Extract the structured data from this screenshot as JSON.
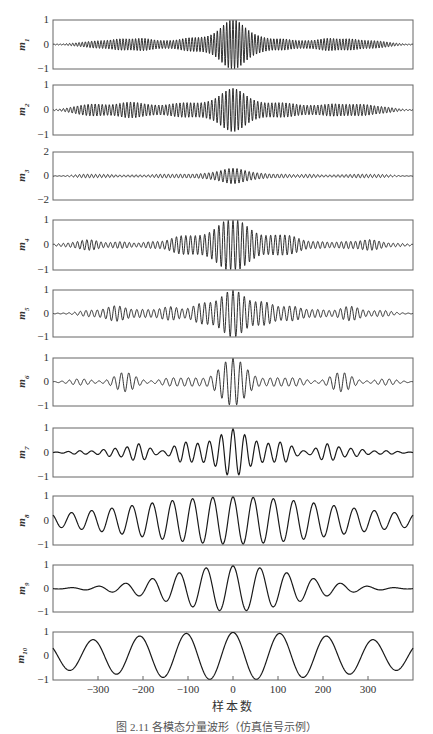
{
  "figure": {
    "xlabel": "样本数",
    "caption": "图 2.11  各模态分量波形（仿真信号示例）"
  },
  "chart_data": {
    "type": "line",
    "title": "",
    "xlabel": "样本数",
    "xlim": [
      -400,
      400
    ],
    "xticks": [
      -300,
      -200,
      -100,
      0,
      100,
      200,
      300
    ],
    "grid": false,
    "legend": null,
    "panels": [
      {
        "name": "m1",
        "ylabel": "m1",
        "ylim": [
          -1,
          1
        ],
        "yticks": [
          "1",
          "0",
          "-1"
        ],
        "style": "dense",
        "freq": 0.9,
        "amp": 1.0,
        "env": "bursts",
        "bursts": [
          [
            -340,
            0.05
          ],
          [
            -300,
            0.12
          ],
          [
            -250,
            0.2
          ],
          [
            -200,
            0.22
          ],
          [
            -150,
            0.12
          ],
          [
            -100,
            0.22
          ],
          [
            -60,
            0.18
          ],
          [
            0,
            1.0
          ],
          [
            60,
            0.22
          ],
          [
            110,
            0.2
          ],
          [
            160,
            0.12
          ],
          [
            210,
            0.22
          ],
          [
            260,
            0.2
          ],
          [
            310,
            0.12
          ],
          [
            345,
            0.05
          ]
        ]
      },
      {
        "name": "m2",
        "ylabel": "m2",
        "ylim": [
          -1,
          1
        ],
        "yticks": [
          "1",
          "0",
          "-1"
        ],
        "style": "dense",
        "freq": 0.8,
        "amp": 0.9,
        "env": "bursts",
        "bursts": [
          [
            -350,
            0.1
          ],
          [
            -315,
            0.18
          ],
          [
            -285,
            0.12
          ],
          [
            -245,
            0.2
          ],
          [
            -215,
            0.22
          ],
          [
            -175,
            0.15
          ],
          [
            -130,
            0.2
          ],
          [
            -95,
            0.22
          ],
          [
            -55,
            0.2
          ],
          [
            0,
            0.95
          ],
          [
            55,
            0.2
          ],
          [
            95,
            0.22
          ],
          [
            130,
            0.2
          ],
          [
            175,
            0.15
          ],
          [
            220,
            0.22
          ],
          [
            260,
            0.15
          ],
          [
            295,
            0.18
          ],
          [
            340,
            0.1
          ]
        ]
      },
      {
        "name": "m3",
        "ylabel": "m3",
        "ylim": [
          -2,
          2
        ],
        "yticks": [
          "2",
          "0",
          "-2"
        ],
        "style": "dense",
        "freq": 0.7,
        "amp": 0.65,
        "env": "bursts",
        "bursts": [
          [
            -330,
            0.12
          ],
          [
            -280,
            0.1
          ],
          [
            -220,
            0.08
          ],
          [
            -160,
            0.12
          ],
          [
            -110,
            0.12
          ],
          [
            -60,
            0.15
          ],
          [
            0,
            0.6
          ],
          [
            60,
            0.15
          ],
          [
            110,
            0.12
          ],
          [
            170,
            0.12
          ],
          [
            230,
            0.08
          ],
          [
            280,
            0.12
          ],
          [
            330,
            0.1
          ]
        ]
      },
      {
        "name": "m4",
        "ylabel": "m4",
        "ylim": [
          -1,
          1
        ],
        "yticks": [
          "1",
          "0",
          "-1"
        ],
        "style": "dense",
        "freq": 0.6,
        "amp": 1.0,
        "env": "bursts",
        "bursts": [
          [
            -370,
            0.05
          ],
          [
            -320,
            0.2
          ],
          [
            -250,
            0.12
          ],
          [
            -180,
            0.12
          ],
          [
            -120,
            0.3
          ],
          [
            -80,
            0.25
          ],
          [
            -40,
            0.25
          ],
          [
            0,
            1.0
          ],
          [
            45,
            0.25
          ],
          [
            90,
            0.3
          ],
          [
            130,
            0.3
          ],
          [
            190,
            0.12
          ],
          [
            250,
            0.12
          ],
          [
            305,
            0.2
          ],
          [
            365,
            0.05
          ]
        ]
      },
      {
        "name": "m5",
        "ylabel": "m5",
        "ylim": [
          -1,
          1
        ],
        "yticks": [
          "1",
          "0",
          "-1"
        ],
        "style": "dense",
        "freq": 0.5,
        "amp": 1.0,
        "env": "bursts",
        "bursts": [
          [
            -320,
            0.12
          ],
          [
            -260,
            0.32
          ],
          [
            -200,
            0.15
          ],
          [
            -140,
            0.28
          ],
          [
            -70,
            0.4
          ],
          [
            0,
            1.0
          ],
          [
            70,
            0.45
          ],
          [
            130,
            0.3
          ],
          [
            190,
            0.15
          ],
          [
            260,
            0.3
          ],
          [
            330,
            0.12
          ]
        ]
      },
      {
        "name": "m6",
        "ylabel": "m6",
        "ylim": [
          -1,
          1
        ],
        "yticks": [
          "1",
          "0",
          "-1"
        ],
        "style": "dense",
        "freq": 0.38,
        "amp": 1.0,
        "env": "bursts",
        "bursts": [
          [
            -340,
            0.12
          ],
          [
            -240,
            0.4
          ],
          [
            -140,
            0.15
          ],
          [
            -90,
            0.15
          ],
          [
            0,
            1.0
          ],
          [
            90,
            0.15
          ],
          [
            140,
            0.15
          ],
          [
            240,
            0.4
          ],
          [
            340,
            0.12
          ]
        ]
      },
      {
        "name": "m7",
        "ylabel": "m7",
        "ylim": [
          -1,
          1
        ],
        "yticks": [
          "1",
          "0",
          "-1"
        ],
        "style": "line",
        "freq": 0.24,
        "amp": 1.0,
        "env": "bursts",
        "bursts": [
          [
            -340,
            0.06
          ],
          [
            -270,
            0.15
          ],
          [
            -210,
            0.35
          ],
          [
            -110,
            0.4
          ],
          [
            -60,
            0.3
          ],
          [
            0,
            1.0
          ],
          [
            60,
            0.3
          ],
          [
            110,
            0.4
          ],
          [
            210,
            0.35
          ],
          [
            270,
            0.15
          ],
          [
            340,
            0.06
          ]
        ]
      },
      {
        "name": "m8",
        "ylabel": "m8",
        "ylim": [
          -1,
          1
        ],
        "yticks": [
          "1",
          "0",
          "-1"
        ],
        "style": "line",
        "freq": 0.14,
        "amp": 1.0,
        "env": "gauss",
        "width": 220,
        "floor": 0.1
      },
      {
        "name": "m9",
        "ylabel": "m9",
        "ylim": [
          -1,
          1
        ],
        "yticks": [
          "1",
          "0",
          "-1"
        ],
        "style": "line",
        "freq": 0.105,
        "amp": 1.0,
        "env": "gauss",
        "width": 140,
        "floor": 0.0
      },
      {
        "name": "m10",
        "ylabel": "m10",
        "ylim": [
          -1,
          1
        ],
        "yticks": [
          "1",
          "0",
          "-1"
        ],
        "style": "line",
        "freq": 0.0605,
        "amp": 1.0,
        "env": "gauss",
        "width": 330,
        "floor": 0.15
      }
    ]
  },
  "layout": {
    "plot_left": 53,
    "plot_right": 413,
    "panel_tops": [
      20,
      85,
      152,
      220,
      290,
      358,
      428,
      496,
      565,
      632
    ],
    "panel_bottoms": [
      69,
      135,
      200,
      270,
      337,
      406,
      477,
      545,
      612,
      680
    ],
    "colors": {
      "line": "#1a1a1a",
      "frame": "#666666"
    }
  }
}
